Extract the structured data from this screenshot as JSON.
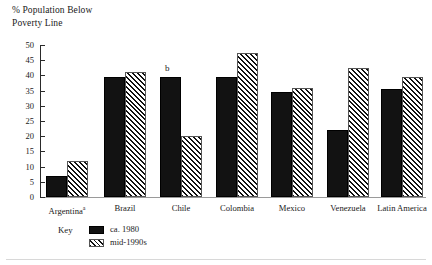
{
  "chart_data": {
    "type": "bar",
    "title": "",
    "ylabel": "% Population Below\nPoverty Line",
    "xlabel": "",
    "ylim": [
      0,
      50
    ],
    "yticks": [
      0,
      5,
      10,
      15,
      20,
      25,
      30,
      35,
      40,
      45,
      50
    ],
    "grid": false,
    "legend_position": "below-left",
    "categories": [
      "Argentina",
      "Brazil",
      "Chile",
      "Colombia",
      "Mexico",
      "Venezuela",
      "Latin America"
    ],
    "category_labels": [
      "Argentinaᵃ",
      "Brazil",
      "Chile",
      "Colombia",
      "Mexico",
      "Venezuela",
      "Latin America"
    ],
    "category_footnotes": [
      "a",
      "",
      "",
      "",
      "",
      "",
      ""
    ],
    "series": [
      {
        "name": "ca. 1980",
        "values": [
          7,
          39.5,
          39.5,
          39.5,
          34.5,
          22,
          35.5
        ]
      },
      {
        "name": "mid-1990s",
        "values": [
          12,
          41,
          20,
          47.5,
          36,
          42.5,
          39.5
        ]
      }
    ],
    "annotations": [
      {
        "text": "b",
        "category": "Chile",
        "series": "ca. 1980"
      }
    ]
  },
  "legend": {
    "key_label": "Key",
    "entries": [
      {
        "label": "ca. 1980",
        "pattern": "solid-black"
      },
      {
        "label": "mid-1990s",
        "pattern": "diagonal-hatch"
      }
    ]
  },
  "colors": {
    "series_1": "#121212",
    "series_2_fill": "#ffffff",
    "series_2_hatch": "#111111",
    "axis": "#2a2a2a",
    "baseline": "#9a9a9a",
    "text": "#1a1a1a",
    "background": "#ffffff"
  }
}
